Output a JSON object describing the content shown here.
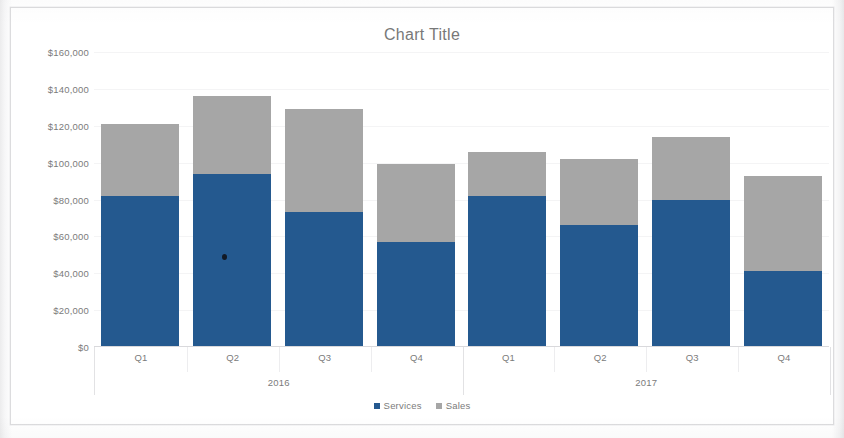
{
  "chart_data": {
    "type": "bar",
    "subtype": "stacked-column",
    "title": "Chart Title",
    "xlabel": "",
    "ylabel": "",
    "categories": [
      "Q1",
      "Q2",
      "Q3",
      "Q4",
      "Q1",
      "Q2",
      "Q3",
      "Q4"
    ],
    "group_labels": [
      "2016",
      "2017"
    ],
    "groups": [
      {
        "label": "2016",
        "categories": [
          "Q1",
          "Q2",
          "Q3",
          "Q4"
        ]
      },
      {
        "label": "2017",
        "categories": [
          "Q1",
          "Q2",
          "Q3",
          "Q4"
        ]
      }
    ],
    "series": [
      {
        "name": "Services",
        "color": "#24598f",
        "values": [
          82000,
          94000,
          73000,
          57000,
          82000,
          66000,
          80000,
          41000
        ]
      },
      {
        "name": "Sales",
        "color": "#a6a6a6",
        "values": [
          39000,
          42000,
          56000,
          42000,
          24000,
          36000,
          34000,
          52000
        ]
      }
    ],
    "totals": [
      121000,
      136000,
      129000,
      99000,
      106000,
      102000,
      114000,
      93000
    ],
    "ylim": [
      0,
      160000
    ],
    "ytick_step": 20000,
    "ytick_labels": [
      "$0",
      "$20,000",
      "$40,000",
      "$60,000",
      "$80,000",
      "$100,000",
      "$120,000",
      "$140,000",
      "$160,000"
    ],
    "ytick_values": [
      0,
      20000,
      40000,
      60000,
      80000,
      100000,
      120000,
      140000,
      160000
    ],
    "grid": true,
    "legend_position": "bottom",
    "legend": [
      {
        "label": "Services",
        "color": "#24598f"
      },
      {
        "label": "Sales",
        "color": "#a6a6a6"
      }
    ],
    "colors": {
      "services": "#24598f",
      "sales": "#a6a6a6",
      "text": "#7b7b7b",
      "axis": "#d9d9dc",
      "plot_background": "#ffffff",
      "frame_border": "#dcdcde"
    }
  }
}
